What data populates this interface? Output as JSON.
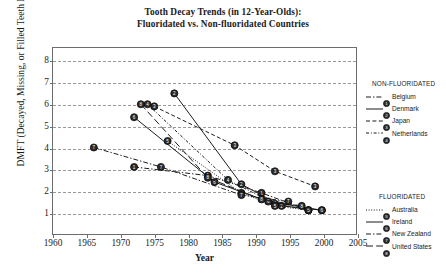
{
  "chart_data": {
    "type": "line",
    "title": "Tooth Decay Trends (in 12-Year-Olds):\nFluoridated vs. Non-fluoridated Countries",
    "title_line1": "Tooth Decay Trends (in 12-Year-Olds):",
    "title_line2": "Fluoridated vs. Non-fluoridated Countries",
    "xlabel": "Year",
    "ylabel": "DMFT (Decayed, Missing, or Filled Teeth Index)",
    "xlim": [
      1960,
      2005
    ],
    "ylim": [
      0,
      8.6
    ],
    "xticks": [
      1960,
      1965,
      1970,
      1975,
      1980,
      1985,
      1990,
      1995,
      2000,
      2005
    ],
    "yticks": [
      1,
      2,
      3,
      4,
      5,
      6,
      7,
      8
    ],
    "grid": "horizontal-dashed",
    "legend_position": "right-outside",
    "series": [
      {
        "name": "Belgium",
        "group": "NON-FLUORIDATED",
        "marker_label": "1",
        "style": "dash-dot",
        "x": [
          1972,
          1983,
          1991,
          1998
        ],
        "y": [
          3.1,
          2.7,
          1.9,
          1.1
        ]
      },
      {
        "name": "Denmark",
        "group": "NON-FLUORIDATED",
        "marker_label": "2",
        "style": "solid",
        "x": [
          1978,
          1988,
          1994,
          2000
        ],
        "y": [
          6.5,
          2.3,
          1.3,
          1.1
        ]
      },
      {
        "name": "Japan",
        "group": "NON-FLUORIDATED",
        "marker_label": "3",
        "style": "dashed",
        "x": [
          1975,
          1987,
          1993,
          1999
        ],
        "y": [
          5.9,
          4.1,
          2.9,
          2.2
        ]
      },
      {
        "name": "Netherlands",
        "group": "NON-FLUORIDATED",
        "marker_label": "4",
        "style": "dash-dot-short",
        "x": [
          1974,
          1986,
          1993,
          1998
        ],
        "y": [
          6.0,
          2.5,
          1.4,
          1.1
        ]
      },
      {
        "name": "Australia",
        "group": "FLUORIDATED",
        "marker_label": "5",
        "style": "dotted",
        "x": [
          1977,
          1988,
          1993,
          1998
        ],
        "y": [
          4.3,
          1.9,
          1.3,
          1.1
        ]
      },
      {
        "name": "Ireland",
        "group": "FLUORIDATED",
        "marker_label": "6",
        "style": "solid",
        "x": [
          1972,
          1984,
          1992,
          2000
        ],
        "y": [
          5.4,
          2.4,
          1.5,
          1.1
        ]
      },
      {
        "name": "New Zealand",
        "group": "FLUORIDATED",
        "marker_label": "7",
        "style": "dash-dot",
        "x": [
          1966,
          1976,
          1988,
          1995
        ],
        "y": [
          4.0,
          3.1,
          1.8,
          1.5
        ]
      },
      {
        "name": "United States",
        "group": "FLUORIDATED",
        "marker_label": "8",
        "style": "dashed-long",
        "x": [
          1973,
          1983,
          1991,
          1997
        ],
        "y": [
          6.0,
          2.6,
          1.6,
          1.3
        ]
      }
    ]
  },
  "legend": {
    "groups": [
      {
        "title": "NON-FLUORIDATED",
        "items": [
          {
            "label": "Belgium",
            "marker_label": "1",
            "style": "dash-dot"
          },
          {
            "label": "Denmark",
            "marker_label": "2",
            "style": "solid"
          },
          {
            "label": "Japan",
            "marker_label": "3",
            "style": "dashed"
          },
          {
            "label": "Netherlands",
            "marker_label": "4",
            "style": "dash-dot-short"
          }
        ]
      },
      {
        "title": "FLUORIDATED",
        "items": [
          {
            "label": "Australia",
            "marker_label": "5",
            "style": "dotted"
          },
          {
            "label": "Ireland",
            "marker_label": "6",
            "style": "solid"
          },
          {
            "label": "New Zealand",
            "marker_label": "7",
            "style": "dash-dot"
          },
          {
            "label": "United States",
            "marker_label": "8",
            "style": "dashed-long"
          }
        ]
      }
    ]
  },
  "colors": {
    "ink": "#1a1a1a",
    "frame": "#6d6d6d",
    "grid": "#9a9a9a",
    "marker_fill": "#2b2b2b"
  }
}
